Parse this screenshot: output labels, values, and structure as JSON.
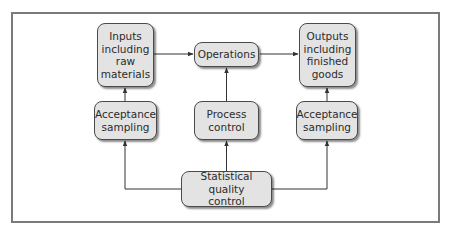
{
  "diagram": {
    "type": "flowchart",
    "colors": {
      "box_fill": "#e3e3e3",
      "box_border": "#4a4a4a",
      "line": "#333333",
      "frame": "#7a7a7a",
      "text": "#2b2b2b"
    },
    "nodes": {
      "inputs": {
        "label": "Inputs including raw materials",
        "lines": [
          "Inputs",
          "including",
          "raw",
          "materials"
        ]
      },
      "operations": {
        "label": "Operations",
        "lines": [
          "Operations"
        ]
      },
      "outputs": {
        "label": "Outputs including finished goods",
        "lines": [
          "Outputs",
          "including",
          "finished",
          "goods"
        ]
      },
      "acceptance_left": {
        "label": "Acceptance sampling",
        "lines": [
          "Acceptance",
          "sampling"
        ]
      },
      "process_control": {
        "label": "Process control",
        "lines": [
          "Process",
          "control"
        ]
      },
      "acceptance_right": {
        "label": "Acceptance sampling",
        "lines": [
          "Acceptance",
          "sampling"
        ]
      },
      "sqc": {
        "label": "Statistical quality control",
        "lines": [
          "Statistical quality",
          "control"
        ]
      }
    },
    "edges": [
      {
        "from": "inputs",
        "to": "operations"
      },
      {
        "from": "operations",
        "to": "outputs"
      },
      {
        "from": "acceptance_left",
        "to": "inputs"
      },
      {
        "from": "process_control",
        "to": "operations"
      },
      {
        "from": "acceptance_right",
        "to": "outputs"
      },
      {
        "from": "sqc",
        "to": "acceptance_left"
      },
      {
        "from": "sqc",
        "to": "process_control"
      },
      {
        "from": "sqc",
        "to": "acceptance_right"
      }
    ]
  }
}
